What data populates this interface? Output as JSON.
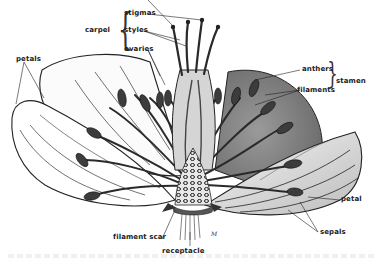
{
  "diagram": {
    "labels": {
      "stigmas": "stigmas",
      "styles": "styles",
      "ovaries": "ovaries",
      "carpel": "carpel",
      "petals": "petals",
      "anthers": "anthers",
      "filaments": "filaments",
      "stamen": "stamen",
      "petal": "petal",
      "sepals": "sepals",
      "filament_scar": "filament scar",
      "receptacle": "receptacle"
    },
    "groups": [
      {
        "name": "carpel",
        "members": [
          "stigmas",
          "styles",
          "ovaries"
        ]
      },
      {
        "name": "stamen",
        "members": [
          "anthers",
          "filaments"
        ]
      }
    ],
    "colors": {
      "ink": "#1a1a1a",
      "dark_fill": "#3a3a3a",
      "mid_fill": "#8a8a8a",
      "light_fill": "#dcdcdc",
      "paper": "#ffffff"
    }
  }
}
